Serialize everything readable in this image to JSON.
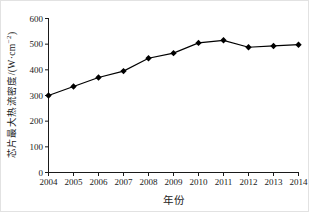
{
  "chart_data": {
    "type": "line",
    "title": "",
    "x": [
      2004,
      2005,
      2006,
      2007,
      2008,
      2009,
      2010,
      2011,
      2012,
      2013,
      2014
    ],
    "series": [
      {
        "name": "芯片最大热流密度",
        "values": [
          300,
          335,
          370,
          395,
          445,
          465,
          505,
          515,
          488,
          493,
          498
        ],
        "color": "#000000",
        "marker": "diamond"
      }
    ],
    "xlabel": "年份",
    "ylabel": "芯片最大热流密度/(W·cm⁻²)",
    "ylabel_parts": {
      "main": "芯片最大热流密度/(W·cm",
      "sup": "−2",
      "suffix": ")"
    },
    "xlim": [
      2004,
      2014
    ],
    "ylim": [
      0,
      600
    ],
    "xticks": [
      2004,
      2005,
      2006,
      2007,
      2008,
      2009,
      2010,
      2011,
      2012,
      2013,
      2014
    ],
    "yticks": [
      0,
      100,
      200,
      300,
      400,
      500,
      600
    ],
    "grid": false,
    "legend": null,
    "axis_color": "#1a1a1a",
    "line_color": "#000000",
    "marker_color": "#000000",
    "background": "#ffffff",
    "tick_font_size": 9
  }
}
